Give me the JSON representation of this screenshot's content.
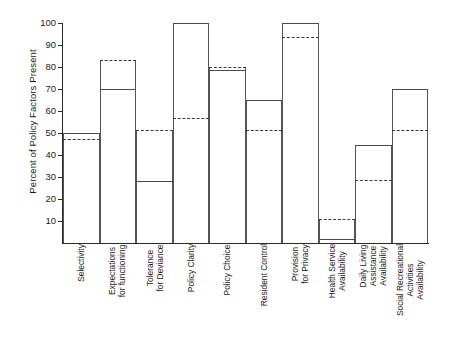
{
  "chart_data": {
    "type": "bar",
    "title": "",
    "xlabel": "",
    "ylabel": "Percent of Policy Factors Present",
    "ylim": [
      0,
      100
    ],
    "yticks": [
      10,
      20,
      30,
      40,
      50,
      60,
      70,
      80,
      90,
      100
    ],
    "ytick_labels": [
      "10",
      "20",
      "30",
      "40",
      "50",
      "60",
      "70",
      "80",
      "90",
      "100"
    ],
    "grid": false,
    "legend": "none",
    "categories": [
      "Selectivity",
      "Expectations\nfor functioning",
      "Tolerance\nfor Deviance",
      "Policy Clarity",
      "Policy Choice",
      "Resident Control",
      "Provision\nfor Privacy",
      "Health Service\nAvailability",
      "Daily Living\nAssistance\nAvailability",
      "Social Recreational\nActivities\nAvailability"
    ],
    "series": [
      {
        "name": "solid",
        "style": "solid",
        "values": [
          50,
          70,
          28,
          100,
          78.5,
          65,
          100,
          2,
          44.5,
          70
        ]
      },
      {
        "name": "dashed",
        "style": "dashed",
        "values": [
          47.5,
          83,
          51.5,
          57,
          80,
          51.5,
          93.5,
          11,
          28.5,
          51.5
        ]
      }
    ],
    "bar_outline_tops": [
      50,
      83,
      51.5,
      100,
      80,
      65,
      100,
      11,
      44.5,
      70
    ]
  }
}
